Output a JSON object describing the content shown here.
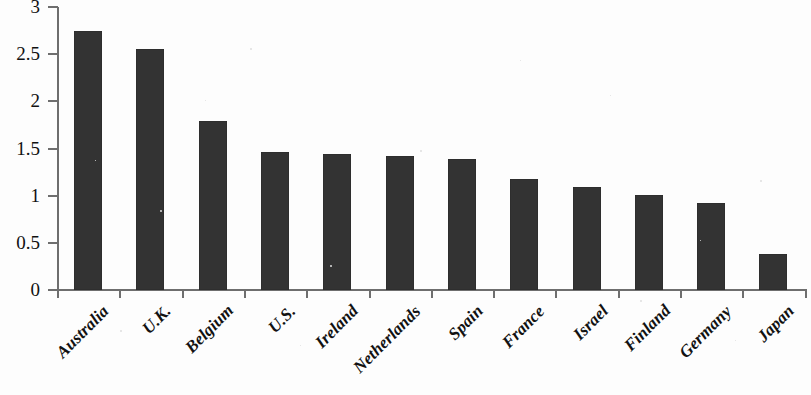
{
  "chart_data": {
    "type": "bar",
    "title": "",
    "subtitle": "",
    "xlabel": "",
    "ylabel": "",
    "ylim": [
      0,
      3
    ],
    "ytick_labels": [
      "0",
      "0.5",
      "1",
      "1.5",
      "2",
      "2.5",
      "3"
    ],
    "ytick_values": [
      0,
      0.5,
      1,
      1.5,
      2,
      2.5,
      3
    ],
    "grid": false,
    "legend": null,
    "bar_color": "#333333",
    "axis_color": "#6e6e6e",
    "categories": [
      "Australia",
      "U.K.",
      "Belgium",
      "U.S.",
      "Ireland",
      "Netherlands",
      "Spain",
      "France",
      "Israel",
      "Finland",
      "Germany",
      "Japan"
    ],
    "values": [
      2.75,
      2.56,
      1.79,
      1.46,
      1.44,
      1.42,
      1.39,
      1.18,
      1.09,
      1.01,
      0.92,
      0.38
    ]
  }
}
